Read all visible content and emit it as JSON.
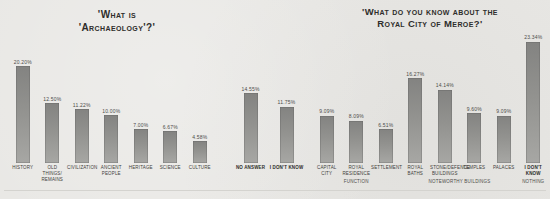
{
  "figure": {
    "background": "#e8e7e4",
    "bar_color_top": "#838381",
    "bar_color_bottom": "#a7a7a4"
  },
  "chart_data": [
    {
      "type": "bar",
      "title": "'What is 'Archaeology'?'",
      "title_lines": [
        "'What is",
        "'Archaeology'?'"
      ],
      "categories": [
        "HISTORY",
        "OLD THINGS/\nREMAINS",
        "CIVILIZATION",
        "ANCIENT PEOPLE",
        "HERITAGE",
        "SCIENCE",
        "CULTURE",
        "NO ANSWER",
        "I DON'T KNOW"
      ],
      "values": [
        20.2,
        12.5,
        11.22,
        10.0,
        7.0,
        6.67,
        4.58,
        14.55,
        11.75
      ],
      "value_labels": [
        "20.20%",
        "12.50%",
        "11.22%",
        "10.00%",
        "7.00%",
        "6.67%",
        "4.58%",
        "14.55%",
        "11.75%"
      ],
      "emphasized_categories": [
        "NO ANSWER",
        "I DON'T KNOW"
      ],
      "separator_before_index": 7,
      "xlabel": "",
      "ylabel": "",
      "ylim": [
        0,
        22
      ],
      "grid": false,
      "legend": false
    },
    {
      "type": "bar",
      "title": "'What do you know about the Royal City of Meroe?'",
      "title_lines": [
        "'What do you know about the",
        "Royal City of Meroe?'"
      ],
      "categories": [
        "CAPITAL CITY",
        "ROYAL\nRESIDENCE",
        "SETTLEMENT",
        "ROYAL BATHS",
        "STONE/DEFENCE\nBUILDINGS",
        "TEMPLES",
        "PALACES",
        "I DON'T KNOW"
      ],
      "values": [
        9.09,
        8.09,
        6.51,
        16.27,
        14.14,
        9.6,
        9.09,
        23.34
      ],
      "value_labels": [
        "9.09%",
        "8.09%",
        "6.51%",
        "16.27%",
        "14.14%",
        "9.60%",
        "9.09%",
        "23.34%"
      ],
      "emphasized_categories": [
        "I DON'T KNOW"
      ],
      "groups": [
        {
          "label": "FUNCTION",
          "span": 3
        },
        {
          "label": "NOTEWORTHY BUILDINGS",
          "span": 4
        },
        {
          "label": "NOTHING",
          "span": 1
        }
      ],
      "xlabel": "",
      "ylabel": "",
      "ylim": [
        0,
        25
      ],
      "grid": false,
      "legend": false
    }
  ]
}
